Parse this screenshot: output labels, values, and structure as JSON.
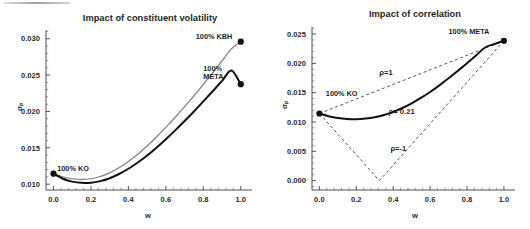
{
  "figure": {
    "width": 530,
    "height": 229,
    "background": "#ffffff",
    "panels": [
      "left",
      "right"
    ]
  },
  "chart_data": [
    {
      "id": "impact-of-constituent-volatility",
      "type": "line",
      "title": "Impact of constituent volatility",
      "xlabel": "w",
      "ylabel": "σₚ",
      "xlim": [
        -0.04,
        1.06
      ],
      "ylim": [
        0.0092,
        0.0312
      ],
      "xticks": [
        "0.0",
        "0.2",
        "0.4",
        "0.6",
        "0.8",
        "1.0"
      ],
      "xtick_values": [
        0.0,
        0.2,
        0.4,
        0.6,
        0.8,
        1.0
      ],
      "yticks": [
        "0.010",
        "0.015",
        "0.020",
        "0.025",
        "0.030"
      ],
      "ytick_values": [
        0.01,
        0.015,
        0.02,
        0.025,
        0.03
      ],
      "grid": false,
      "legend": "none",
      "series": [
        {
          "name": "KO-KBH frontier",
          "style": "thin-gray",
          "color": "#7d7d7d",
          "x": [
            0.0,
            0.05,
            0.1,
            0.15,
            0.2,
            0.25,
            0.3,
            0.35,
            0.4,
            0.45,
            0.5,
            0.55,
            0.6,
            0.65,
            0.7,
            0.75,
            0.8,
            0.85,
            0.9,
            0.95,
            1.0
          ],
          "values": [
            0.01145,
            0.01102,
            0.01075,
            0.01065,
            0.01075,
            0.01105,
            0.01155,
            0.01225,
            0.01312,
            0.01412,
            0.01525,
            0.01648,
            0.0178,
            0.0192,
            0.02065,
            0.02215,
            0.02372,
            0.02532,
            0.02695,
            0.0286,
            0.0296
          ]
        },
        {
          "name": "KO-META frontier",
          "style": "thick-black",
          "color": "#111111",
          "x": [
            0.0,
            0.05,
            0.1,
            0.15,
            0.2,
            0.25,
            0.3,
            0.35,
            0.4,
            0.45,
            0.5,
            0.55,
            0.6,
            0.65,
            0.7,
            0.75,
            0.8,
            0.85,
            0.9,
            0.95,
            1.0
          ],
          "values": [
            0.01145,
            0.01075,
            0.01035,
            0.01018,
            0.0102,
            0.01042,
            0.01082,
            0.0114,
            0.01212,
            0.01298,
            0.01395,
            0.01502,
            0.01618,
            0.0174,
            0.01868,
            0.02,
            0.02138,
            0.02278,
            0.0242,
            0.02562,
            0.02375
          ]
        }
      ],
      "annotations": [
        {
          "text": "100%  KO",
          "x": 0.02,
          "y": 0.0118,
          "marker": true,
          "marker_x": 0.0,
          "marker_y": 0.01145
        },
        {
          "text": "100%  KBH",
          "x": 0.76,
          "y": 0.03,
          "marker": true,
          "marker_x": 1.0,
          "marker_y": 0.0296
        },
        {
          "text": "100%",
          "x": 0.8,
          "y": 0.0256,
          "marker": false
        },
        {
          "text": "META",
          "x": 0.8,
          "y": 0.0245,
          "marker": true,
          "marker_x": 1.0,
          "marker_y": 0.02375
        }
      ]
    },
    {
      "id": "impact-of-correlation",
      "type": "line",
      "title": "Impact of correlation",
      "xlabel": "w",
      "ylabel": "σₚ",
      "xlim": [
        -0.04,
        1.06
      ],
      "ylim": [
        -0.0016,
        0.0262
      ],
      "xticks": [
        "0.0",
        "0.2",
        "0.4",
        "0.6",
        "0.8",
        "1.0"
      ],
      "xtick_values": [
        0.0,
        0.2,
        0.4,
        0.6,
        0.8,
        1.0
      ],
      "yticks": [
        "0.000",
        "0.005",
        "0.010",
        "0.015",
        "0.020",
        "0.025"
      ],
      "ytick_values": [
        0.0,
        0.005,
        0.01,
        0.015,
        0.02,
        0.025
      ],
      "grid": false,
      "legend": "none",
      "series": [
        {
          "name": "rho = 1",
          "style": "dashed",
          "color": "#4a4a4a",
          "x": [
            0.0,
            1.0
          ],
          "values": [
            0.01145,
            0.02385
          ]
        },
        {
          "name": "rho = 0.21",
          "style": "thick-black",
          "color": "#111111",
          "x": [
            0.0,
            0.05,
            0.1,
            0.15,
            0.2,
            0.25,
            0.3,
            0.35,
            0.4,
            0.45,
            0.5,
            0.55,
            0.6,
            0.65,
            0.7,
            0.75,
            0.8,
            0.85,
            0.9,
            0.95,
            1.0
          ],
          "values": [
            0.01145,
            0.01098,
            0.01068,
            0.01052,
            0.01048,
            0.01058,
            0.01082,
            0.0112,
            0.01172,
            0.01238,
            0.01318,
            0.0141,
            0.01512,
            0.01625,
            0.01745,
            0.01872,
            0.02002,
            0.02138,
            0.02275,
            0.0233,
            0.02385
          ]
        },
        {
          "name": "rho = -1",
          "style": "dashed",
          "color": "#4a4a4a",
          "x": [
            0.0,
            0.325,
            1.0
          ],
          "values": [
            0.01145,
            0.0,
            0.02385
          ]
        }
      ],
      "annotations": [
        {
          "text": "100% KO",
          "x": 0.035,
          "y": 0.0145,
          "marker": true,
          "marker_x": 0.0,
          "marker_y": 0.01145
        },
        {
          "text": "100% META",
          "x": 0.7,
          "y": 0.025,
          "marker": true,
          "marker_x": 1.0,
          "marker_y": 0.02385
        },
        {
          "text": "ρ=1",
          "x": 0.325,
          "y": 0.018
        },
        {
          "text": "ρ= 0.21",
          "x": 0.375,
          "y": 0.0113
        },
        {
          "text": "ρ=-1",
          "x": 0.385,
          "y": 0.005
        }
      ]
    }
  ]
}
